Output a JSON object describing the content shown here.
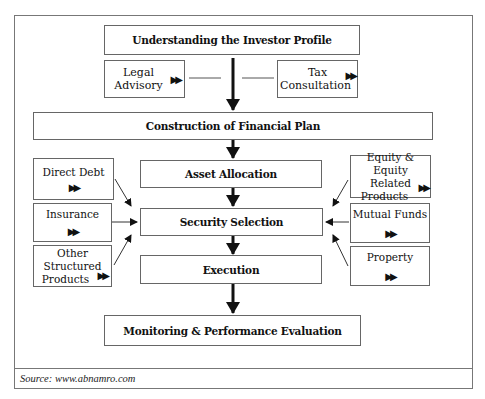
{
  "diagram": {
    "main_flow": [
      {
        "id": "investor_profile",
        "label": "Understanding the Investor Profile"
      },
      {
        "id": "financial_plan",
        "label": "Construction of Financial Plan"
      },
      {
        "id": "asset_allocation",
        "label": "Asset Allocation"
      },
      {
        "id": "security_selection",
        "label": "Security Selection"
      },
      {
        "id": "execution",
        "label": "Execution"
      },
      {
        "id": "monitoring",
        "label": "Monitoring & Performance Evaluation"
      }
    ],
    "advisory": [
      {
        "id": "legal",
        "line1": "Legal",
        "line2": "Advisory"
      },
      {
        "id": "tax",
        "line1": "Tax",
        "line2": "Consultation"
      }
    ],
    "left_inputs": [
      {
        "id": "direct_debt",
        "line1": "Direct Debt"
      },
      {
        "id": "insurance",
        "line1": "Insurance"
      },
      {
        "id": "other_structured",
        "line1": "Other",
        "line2": "Structured",
        "line3": "Products"
      }
    ],
    "right_inputs": [
      {
        "id": "equity",
        "line1": "Equity & Equity",
        "line2": "Related",
        "line3": "Products"
      },
      {
        "id": "mutual_funds",
        "line1": "Mutual Funds"
      },
      {
        "id": "property",
        "line1": "Property"
      }
    ],
    "marker_glyph": "▶▶",
    "edges": [
      [
        "investor_profile",
        "financial_plan"
      ],
      [
        "financial_plan",
        "asset_allocation"
      ],
      [
        "asset_allocation",
        "security_selection"
      ],
      [
        "security_selection",
        "execution"
      ],
      [
        "execution",
        "monitoring"
      ],
      [
        "direct_debt",
        "security_selection"
      ],
      [
        "insurance",
        "security_selection"
      ],
      [
        "other_structured",
        "security_selection"
      ],
      [
        "equity",
        "security_selection"
      ],
      [
        "mutual_funds",
        "security_selection"
      ],
      [
        "property",
        "security_selection"
      ],
      [
        "legal",
        "investor_profile_arrow"
      ],
      [
        "tax",
        "investor_profile_arrow"
      ]
    ]
  },
  "source": "Source: www.abnamro.com"
}
